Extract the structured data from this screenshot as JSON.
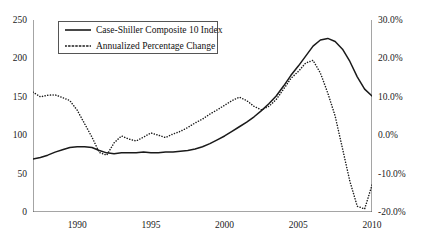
{
  "chart_data": {
    "type": "line",
    "title": "",
    "xlabel": "",
    "grid": false,
    "legend_position": "top-left",
    "x": [
      1987.0,
      1987.5,
      1988.0,
      1988.5,
      1989.0,
      1989.5,
      1990.0,
      1990.5,
      1991.0,
      1991.5,
      1992.0,
      1992.5,
      1993.0,
      1993.5,
      1994.0,
      1994.5,
      1995.0,
      1995.5,
      1996.0,
      1996.5,
      1997.0,
      1997.5,
      1998.0,
      1998.5,
      1999.0,
      1999.5,
      2000.0,
      2000.5,
      2001.0,
      2001.5,
      2002.0,
      2002.5,
      2003.0,
      2003.5,
      2004.0,
      2004.5,
      2005.0,
      2005.5,
      2006.0,
      2006.5,
      2007.0,
      2007.5,
      2008.0,
      2008.5,
      2009.0,
      2009.5,
      2010.0
    ],
    "xlim": [
      1987.0,
      2010.0
    ],
    "xticks_major": [
      1990,
      1995,
      2000,
      2005,
      2010
    ],
    "xticks_major_labels": [
      "1990",
      "1995",
      "2000",
      "2005",
      "2010"
    ],
    "xticks_minor_step": 1,
    "axes": [
      {
        "id": "left",
        "ylabel": "",
        "ylim": [
          0,
          250
        ],
        "yticks": [
          0,
          50,
          100,
          150,
          200,
          250
        ],
        "ytick_labels": [
          "0",
          "50",
          "100",
          "150",
          "200",
          "250"
        ]
      },
      {
        "id": "right",
        "ylabel": "",
        "ylim": [
          -20,
          30
        ],
        "yticks": [
          -20,
          -10,
          0,
          10,
          20,
          30
        ],
        "ytick_labels": [
          "-20.0%",
          "-10.0%",
          "0.0%",
          "10.0%",
          "20.0%",
          "30.0%"
        ]
      }
    ],
    "series": [
      {
        "name": "Case-Shiller Composite 10 Index",
        "axis": "left",
        "style": "solid",
        "color": "#1a1a1a",
        "values": [
          69,
          71,
          74,
          78,
          81,
          84,
          85,
          85,
          84,
          80,
          77,
          76,
          77,
          77,
          77,
          78,
          77,
          77,
          78,
          78,
          79,
          80,
          82,
          85,
          89,
          94,
          99,
          105,
          111,
          117,
          124,
          132,
          141,
          151,
          164,
          178,
          190,
          203,
          216,
          224,
          226,
          222,
          212,
          196,
          176,
          160,
          151
        ]
      },
      {
        "name": "Annualized Percentage Change",
        "axis": "right",
        "style": "dotted",
        "color": "#1a1a1a",
        "values": [
          11.2,
          10.0,
          10.4,
          10.5,
          9.8,
          9.0,
          6.5,
          3.0,
          -0.5,
          -4.5,
          -5.2,
          -2.0,
          -0.2,
          -1.0,
          -1.5,
          -0.5,
          0.6,
          0.0,
          -0.6,
          0.3,
          1.0,
          2.0,
          3.2,
          4.2,
          5.5,
          6.6,
          7.8,
          9.0,
          9.9,
          9.0,
          7.5,
          6.6,
          7.5,
          9.3,
          12.0,
          14.8,
          16.6,
          18.8,
          19.5,
          16.2,
          11.0,
          5.0,
          -3.5,
          -12.0,
          -18.5,
          -19.2,
          -13.0
        ]
      }
    ]
  },
  "legend": {
    "items": [
      {
        "label": "Case-Shiller Composite 10 Index",
        "style": "solid"
      },
      {
        "label": "Annualized Percentage Change",
        "style": "dotted"
      }
    ]
  }
}
